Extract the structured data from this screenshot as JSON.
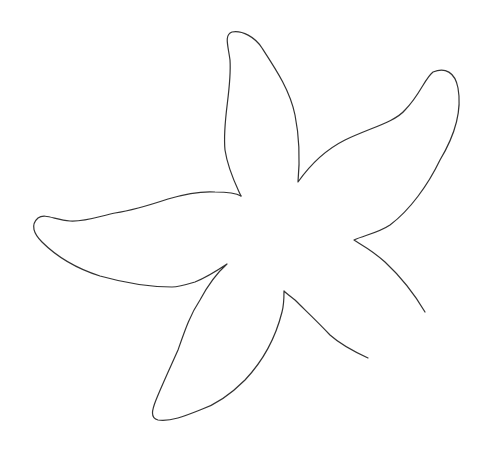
{
  "image": {
    "subject": "starfish line drawing",
    "stroke_color": "#333333",
    "background_color": "#ffffff"
  }
}
